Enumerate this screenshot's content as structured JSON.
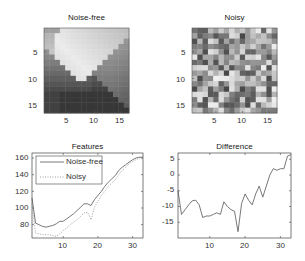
{
  "chart_data": [
    {
      "type": "heatmap",
      "title": "Noise-free",
      "xlabel": "",
      "ylabel": "",
      "xticks": [
        5,
        10,
        15
      ],
      "yticks": [
        5,
        10,
        15
      ],
      "size": [
        16,
        16
      ],
      "colormap": "gray",
      "description": "Diagonal gradient: bright upper-left triangle, dark lower-right region"
    },
    {
      "type": "heatmap",
      "title": "Noisy",
      "xlabel": "",
      "ylabel": "",
      "xticks": [
        5,
        10,
        15
      ],
      "yticks": [
        5,
        10,
        15
      ],
      "size": [
        16,
        16
      ],
      "colormap": "gray",
      "description": "Random grayscale noise pattern"
    },
    {
      "type": "line",
      "title": "Features",
      "xlabel": "",
      "ylabel": "",
      "xticks": [
        10,
        20,
        30
      ],
      "yticks": [
        80,
        100,
        120,
        140,
        160
      ],
      "xlim": [
        1,
        33
      ],
      "ylim": [
        64,
        166
      ],
      "legend": [
        "Noise-free",
        "Noisy"
      ],
      "legend_position": "upper-left",
      "x": [
        1,
        2,
        3,
        4,
        5,
        6,
        7,
        8,
        9,
        10,
        11,
        12,
        13,
        14,
        15,
        16,
        17,
        18,
        19,
        20,
        21,
        22,
        23,
        24,
        25,
        26,
        27,
        28,
        29,
        30,
        31,
        32,
        33
      ],
      "series": [
        {
          "name": "Noise-free",
          "style": "solid",
          "values": [
            112,
            82,
            80,
            78,
            77,
            78,
            79,
            81,
            84,
            84,
            87,
            90,
            93,
            97,
            101,
            105,
            105,
            103,
            110,
            115,
            120,
            126,
            131,
            135,
            139,
            145,
            149,
            152,
            155,
            158,
            160,
            161,
            161
          ]
        },
        {
          "name": "Noisy",
          "style": "dotted",
          "values": [
            106,
            70,
            69,
            68,
            68,
            68,
            67,
            66,
            69,
            73,
            76,
            80,
            83,
            86,
            90,
            94,
            95,
            86,
            101,
            108,
            115,
            120,
            126,
            130,
            134,
            140,
            145,
            149,
            153,
            156,
            158,
            160,
            160
          ]
        }
      ]
    },
    {
      "type": "line",
      "title": "Difference",
      "xlabel": "",
      "ylabel": "",
      "xticks": [
        10,
        20,
        30
      ],
      "yticks": [
        -15,
        -10,
        -5,
        0,
        5
      ],
      "xlim": [
        1,
        33
      ],
      "ylim": [
        -20,
        7
      ],
      "x": [
        1,
        2,
        3,
        4,
        5,
        6,
        7,
        8,
        9,
        10,
        11,
        12,
        13,
        14,
        15,
        16,
        17,
        18,
        19,
        20,
        21,
        22,
        23,
        24,
        25,
        26,
        27,
        28,
        29,
        30,
        31,
        32,
        33
      ],
      "series": [
        {
          "name": "Difference",
          "style": "solid",
          "values": [
            -5,
            -12.5,
            -11,
            -9.5,
            -8.2,
            -8,
            -9.5,
            -13.5,
            -13,
            -13,
            -12.5,
            -12,
            -12.5,
            -8.5,
            -10,
            -11,
            -11.5,
            -18,
            -9,
            -6,
            -8,
            -9.5,
            -6,
            -3.5,
            -7,
            -3.5,
            0,
            2,
            1.5,
            2,
            2,
            6,
            6.5
          ]
        }
      ]
    }
  ],
  "panels": {
    "noise_free": {
      "title": "Noise-free",
      "xticks": [
        "5",
        "10",
        "15"
      ],
      "yticks": [
        "5",
        "10",
        "15"
      ]
    },
    "noisy": {
      "title": "Noisy",
      "xticks": [
        "5",
        "10",
        "15"
      ],
      "yticks": [
        "5",
        "10",
        "15"
      ]
    },
    "features": {
      "title": "Features",
      "xticks": [
        "10",
        "20",
        "30"
      ],
      "yticks": [
        "160",
        "140",
        "120",
        "100",
        "80"
      ],
      "legend": {
        "noise_free": "Noise-free",
        "noisy": "Noisy"
      }
    },
    "difference": {
      "title": "Difference",
      "xticks": [
        "10",
        "20",
        "30"
      ],
      "yticks": [
        "5",
        "0",
        "-5",
        "-10",
        "-15"
      ]
    }
  },
  "colors": {
    "line": "#555555",
    "axis": "#444444",
    "background": "#ffffff"
  }
}
